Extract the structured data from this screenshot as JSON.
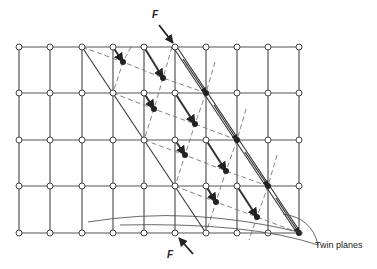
{
  "diagram": {
    "type": "mechanical-twinning-lattice",
    "colors": {
      "line": "#555555",
      "dashed": "#777777",
      "atom_fill_open": "#ffffff",
      "atom_fill_twinned": "#222222",
      "arrow": "#333333"
    },
    "grid": {
      "cols_x": [
        19,
        50,
        82,
        113,
        144,
        175,
        206,
        237,
        268,
        299
      ],
      "rows_y": [
        47,
        93,
        140,
        186,
        233
      ]
    },
    "twin_planes": [
      {
        "from": [
          82,
          47
        ],
        "to": [
          206,
          233
        ],
        "style": "single"
      },
      {
        "from": [
          175,
          47
        ],
        "to": [
          299,
          233
        ],
        "style": "double"
      }
    ],
    "twinned_rows": [
      [
        [
          82,
          47
        ],
        [
          123,
          62
        ],
        [
          163,
          78
        ],
        [
          206,
          93
        ]
      ],
      [
        [
          113,
          93
        ],
        [
          154,
          109
        ],
        [
          195,
          124
        ],
        [
          237,
          140
        ]
      ],
      [
        [
          144,
          140
        ],
        [
          185,
          155
        ],
        [
          226,
          171
        ],
        [
          268,
          186
        ]
      ],
      [
        [
          175,
          186
        ],
        [
          216,
          202
        ],
        [
          257,
          217
        ],
        [
          299,
          233
        ]
      ]
    ],
    "twinned_columns": [
      [
        [
          131,
          47
        ],
        [
          123,
          62
        ],
        [
          113,
          93
        ]
      ],
      [
        [
          172,
          47
        ],
        [
          163,
          78
        ],
        [
          154,
          109
        ],
        [
          144,
          140
        ]
      ],
      [
        [
          215,
          62
        ],
        [
          206,
          93
        ],
        [
          195,
          124
        ],
        [
          185,
          155
        ],
        [
          175,
          186
        ]
      ],
      [
        [
          246,
          109
        ],
        [
          237,
          140
        ],
        [
          226,
          171
        ],
        [
          216,
          202
        ],
        [
          206,
          233
        ]
      ],
      [
        [
          277,
          155
        ],
        [
          268,
          186
        ],
        [
          257,
          217
        ],
        [
          249,
          240
        ]
      ]
    ],
    "displacement_arrows": [
      {
        "from": [
          113,
          47
        ],
        "to": [
          123,
          62
        ]
      },
      {
        "from": [
          144,
          47
        ],
        "to": [
          163,
          78
        ]
      },
      {
        "from": [
          144,
          93
        ],
        "to": [
          154,
          109
        ]
      },
      {
        "from": [
          175,
          93
        ],
        "to": [
          195,
          124
        ]
      },
      {
        "from": [
          175,
          140
        ],
        "to": [
          185,
          155
        ]
      },
      {
        "from": [
          206,
          140
        ],
        "to": [
          226,
          171
        ]
      },
      {
        "from": [
          206,
          186
        ],
        "to": [
          216,
          202
        ]
      },
      {
        "from": [
          237,
          186
        ],
        "to": [
          257,
          217
        ]
      },
      {
        "from": [
          183,
          59
        ],
        "to": [
          206,
          93
        ],
        "double": true
      },
      {
        "from": [
          214,
          105
        ],
        "to": [
          237,
          140
        ],
        "double": true
      },
      {
        "from": [
          245,
          152
        ],
        "to": [
          268,
          186
        ],
        "double": true
      },
      {
        "from": [
          276,
          198
        ],
        "to": [
          299,
          233
        ],
        "double": true
      }
    ],
    "force_arrows": [
      {
        "from": [
          159,
          25
        ],
        "to": [
          173,
          43
        ]
      },
      {
        "from": [
          193,
          254
        ],
        "to": [
          179,
          238
        ]
      }
    ],
    "labels": {
      "force_top": "F",
      "force_bottom": "F",
      "twin_planes": "Twin planes"
    }
  }
}
